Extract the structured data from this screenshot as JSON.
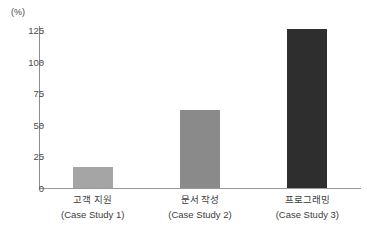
{
  "chart_data": {
    "type": "bar",
    "title": "",
    "xlabel": "",
    "ylabel": "(%)",
    "unit_label": "(%)",
    "categories": [
      "고객 지원",
      "문서 작성",
      "프로그래밍"
    ],
    "category_sublabels": [
      "(Case Study 1)",
      "(Case Study 2)",
      "(Case Study 3)"
    ],
    "values": [
      17,
      62,
      126
    ],
    "ylim": [
      0,
      135
    ],
    "yticks": [
      0,
      25,
      50,
      75,
      100,
      125
    ],
    "ytick_labels": [
      "0",
      "25",
      "50",
      "75",
      "100",
      "125"
    ],
    "grid": false,
    "legend": false,
    "bar_colors": [
      "#a5a5a5",
      "#8a8a8a",
      "#2e2e2e"
    ],
    "axis_color": "#8d8d8d",
    "text_color": "#3d3d3d"
  }
}
